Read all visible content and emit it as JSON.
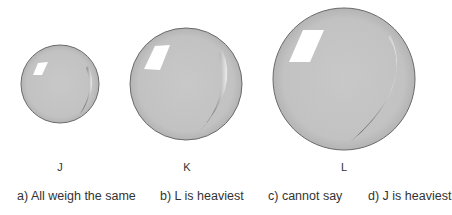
{
  "spheres": [
    {
      "id": "J",
      "label": "J",
      "cx": 60,
      "cy": 84,
      "r": 39
    },
    {
      "id": "K",
      "label": "K",
      "cx": 186,
      "cy": 84,
      "r": 56
    },
    {
      "id": "L",
      "label": "L",
      "cx": 344,
      "cy": 79,
      "r": 71
    }
  ],
  "options": [
    {
      "key": "a",
      "text": "a) All weigh the same"
    },
    {
      "key": "b",
      "text": "b) L is heaviest"
    },
    {
      "key": "c",
      "text": "c) cannot say"
    },
    {
      "key": "d",
      "text": "d) J is heaviest"
    }
  ],
  "colors": {
    "sphere_fill": "#c4c4c4",
    "sphere_stroke": "#6a6a6a",
    "highlight": "#ffffff",
    "shadow": "#3a3a3a"
  }
}
